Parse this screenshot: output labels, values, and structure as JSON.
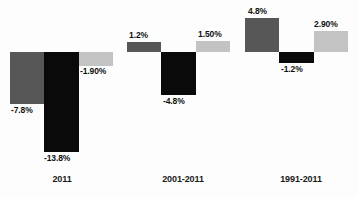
{
  "chart_data": {
    "type": "bar",
    "title": "",
    "subtitle": "",
    "xlabel": "",
    "ylabel": "",
    "grid": false,
    "legend": "none",
    "orientation": "vertical",
    "baseline": 0,
    "unit": "%",
    "ylim": [
      -14.5,
      5.5
    ],
    "categories": [
      "2011",
      "2001-2011",
      "1991-2011"
    ],
    "series": [
      {
        "name": "series-1",
        "color": "#575757",
        "values": [
          -7.8,
          1.2,
          4.8
        ],
        "labels": [
          "-7.8%",
          "1.2%",
          "4.8%"
        ]
      },
      {
        "name": "series-2",
        "color": "#0a0a0a",
        "values": [
          -13.8,
          -4.8,
          -1.2
        ],
        "labels": [
          "-13.8%",
          "-4.8%",
          "-1.2%"
        ]
      },
      {
        "name": "series-3",
        "color": "#c3c3c3",
        "values": [
          -1.9,
          1.5,
          2.9
        ],
        "labels": [
          "-1.90%",
          "1.50%",
          "2.90%"
        ]
      }
    ]
  },
  "bars": [
    {
      "id": "bar-2011-s1",
      "label": "-7.8%",
      "value": -7.8,
      "color": "#575757",
      "x": 10,
      "y": 52,
      "w": 34,
      "h": 52,
      "label_x": 11,
      "label_y": 105
    },
    {
      "id": "bar-2011-s2",
      "label": "-13.8%",
      "value": -13.8,
      "color": "#0a0a0a",
      "x": 44,
      "y": 52,
      "w": 35,
      "h": 100,
      "label_x": 44,
      "label_y": 153
    },
    {
      "id": "bar-2011-s3",
      "label": "-1.90%",
      "value": -1.9,
      "color": "#c3c3c3",
      "x": 79,
      "y": 52,
      "w": 34,
      "h": 14,
      "label_x": 80,
      "label_y": 66
    },
    {
      "id": "bar-2001-2011-s1",
      "label": "1.2%",
      "value": 1.2,
      "color": "#575757",
      "x": 127,
      "y": 42,
      "w": 34,
      "h": 10,
      "label_x": 129,
      "label_y": 30
    },
    {
      "id": "bar-2001-2011-s2",
      "label": "-4.8%",
      "value": -4.8,
      "color": "#0a0a0a",
      "x": 161,
      "y": 52,
      "w": 35,
      "h": 43,
      "label_x": 163,
      "label_y": 96
    },
    {
      "id": "bar-2001-2011-s3",
      "label": "1.50%",
      "value": 1.5,
      "color": "#c3c3c3",
      "x": 196,
      "y": 41,
      "w": 34,
      "h": 11,
      "label_x": 198,
      "label_y": 29
    },
    {
      "id": "bar-1991-2011-s1",
      "label": "4.8%",
      "value": 4.8,
      "color": "#575757",
      "x": 245,
      "y": 18,
      "w": 34,
      "h": 34,
      "label_x": 248,
      "label_y": 6
    },
    {
      "id": "bar-1991-2011-s2",
      "label": "-1.2%",
      "value": -1.2,
      "color": "#0a0a0a",
      "x": 279,
      "y": 52,
      "w": 35,
      "h": 11,
      "label_x": 281,
      "label_y": 64
    },
    {
      "id": "bar-1991-2011-s3",
      "label": "2.90%",
      "value": 2.9,
      "color": "#c3c3c3",
      "x": 314,
      "y": 31,
      "w": 34,
      "h": 21,
      "label_x": 314,
      "label_y": 19
    }
  ],
  "category_labels": [
    {
      "text": "2011",
      "x": 32,
      "y": 174,
      "w": 60
    },
    {
      "text": "2001-2011",
      "x": 148,
      "y": 174,
      "w": 70
    },
    {
      "text": "1991-2011",
      "x": 266,
      "y": 174,
      "w": 70
    }
  ]
}
